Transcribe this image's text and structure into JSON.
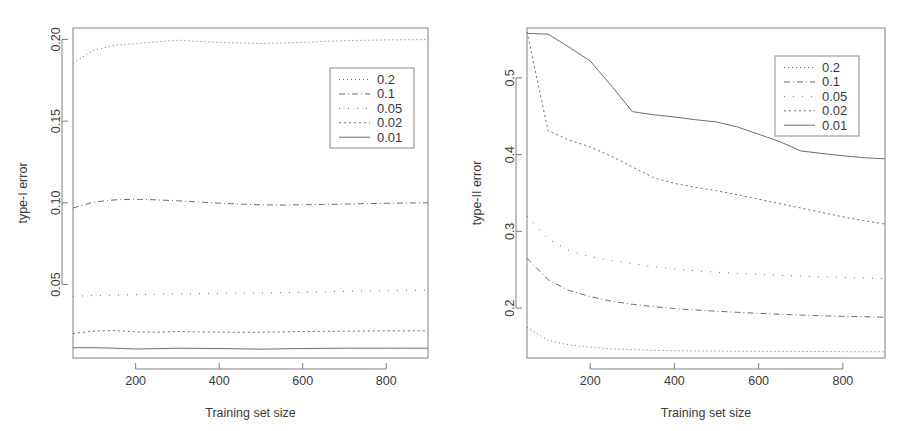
{
  "figure": {
    "panel_count": 2,
    "background_color": "#ffffff",
    "line_color": "#6e6e6e",
    "axis_color": "#808080"
  },
  "chart_data": [
    {
      "type": "line",
      "title": "",
      "xlabel": "Training set size",
      "ylabel": "type-I error",
      "xlim": [
        50,
        900
      ],
      "ylim": [
        0.005,
        0.207
      ],
      "xticks": [
        200,
        400,
        600,
        800
      ],
      "yticks": [
        0.05,
        0.1,
        0.15,
        0.2
      ],
      "ytick_labels": [
        "0.05",
        "0.10",
        "0.15",
        "0.20"
      ],
      "xtick_labels": [
        "200",
        "400",
        "600",
        "800"
      ],
      "grid": false,
      "legend_position": "upper right",
      "legend_title": "",
      "x": [
        50,
        100,
        150,
        200,
        250,
        300,
        350,
        400,
        450,
        500,
        550,
        600,
        650,
        700,
        750,
        800,
        850,
        900
      ],
      "series": [
        {
          "name": "0.2",
          "dash": "1,3",
          "width": 1,
          "values": [
            0.1855,
            0.1935,
            0.1965,
            0.1975,
            0.1985,
            0.1995,
            0.1988,
            0.1982,
            0.1978,
            0.1975,
            0.1978,
            0.1982,
            0.1988,
            0.1992,
            0.1995,
            0.1997,
            0.1998,
            0.1999
          ]
        },
        {
          "name": "0.1",
          "dash": "6,3,1,3",
          "width": 1,
          "values": [
            0.0968,
            0.1005,
            0.1018,
            0.1022,
            0.1018,
            0.1012,
            0.1005,
            0.0998,
            0.0992,
            0.0988,
            0.0986,
            0.0988,
            0.099,
            0.0992,
            0.0995,
            0.0997,
            0.0999,
            0.1
          ]
        },
        {
          "name": "0.05",
          "dash": "1,8",
          "width": 1,
          "values": [
            0.0428,
            0.0432,
            0.0435,
            0.0438,
            0.044,
            0.0442,
            0.0444,
            0.0446,
            0.0447,
            0.0448,
            0.045,
            0.0452,
            0.0455,
            0.0458,
            0.046,
            0.0462,
            0.0464,
            0.0465
          ]
        },
        {
          "name": "0.02",
          "dash": "2,3",
          "width": 1,
          "values": [
            0.02,
            0.0215,
            0.0218,
            0.021,
            0.0208,
            0.0212,
            0.021,
            0.0208,
            0.0207,
            0.0208,
            0.021,
            0.0212,
            0.0213,
            0.0214,
            0.0215,
            0.0216,
            0.0216,
            0.0217
          ]
        },
        {
          "name": "0.01",
          "dash": "",
          "width": 1,
          "values": [
            0.0113,
            0.0113,
            0.011,
            0.0105,
            0.0107,
            0.011,
            0.0109,
            0.0108,
            0.0106,
            0.0104,
            0.0106,
            0.0108,
            0.0109,
            0.011,
            0.011,
            0.011,
            0.011,
            0.011
          ]
        }
      ]
    },
    {
      "type": "line",
      "title": "",
      "xlabel": "Training set size",
      "ylabel": "type-II error",
      "xlim": [
        50,
        900
      ],
      "ylim": [
        0.135,
        0.565
      ],
      "xticks": [
        200,
        400,
        600,
        800
      ],
      "yticks": [
        0.2,
        0.3,
        0.4,
        0.5
      ],
      "ytick_labels": [
        "0.2",
        "0.3",
        "0.4",
        "0.5"
      ],
      "xtick_labels": [
        "200",
        "400",
        "600",
        "800"
      ],
      "grid": false,
      "legend_position": "upper right",
      "legend_title": "",
      "x": [
        50,
        100,
        150,
        200,
        250,
        300,
        350,
        400,
        450,
        500,
        550,
        600,
        650,
        700,
        750,
        800,
        850,
        900
      ],
      "series": [
        {
          "name": "0.2",
          "dash": "1,3",
          "width": 1,
          "values": [
            0.175,
            0.158,
            0.152,
            0.149,
            0.147,
            0.146,
            0.145,
            0.1445,
            0.1442,
            0.144,
            0.1438,
            0.1437,
            0.1436,
            0.1435,
            0.1434,
            0.1433,
            0.1432,
            0.143
          ]
        },
        {
          "name": "0.1",
          "dash": "6,3,1,3",
          "width": 1,
          "values": [
            0.265,
            0.237,
            0.223,
            0.215,
            0.209,
            0.205,
            0.202,
            0.1995,
            0.1975,
            0.196,
            0.1945,
            0.1932,
            0.192,
            0.191,
            0.19,
            0.1893,
            0.1887,
            0.1882
          ]
        },
        {
          "name": "0.05",
          "dash": "1,8",
          "width": 1,
          "values": [
            0.32,
            0.29,
            0.275,
            0.267,
            0.262,
            0.258,
            0.254,
            0.251,
            0.2487,
            0.2468,
            0.2452,
            0.244,
            0.2428,
            0.2418,
            0.2408,
            0.24,
            0.2392,
            0.2385
          ]
        },
        {
          "name": "0.02",
          "dash": "2,3",
          "width": 1,
          "values": [
            0.56,
            0.431,
            0.419,
            0.41,
            0.398,
            0.384,
            0.37,
            0.3625,
            0.3575,
            0.353,
            0.3478,
            0.342,
            0.336,
            0.3305,
            0.3245,
            0.319,
            0.314,
            0.3095
          ]
        },
        {
          "name": "0.01",
          "dash": "",
          "width": 1,
          "values": [
            0.558,
            0.557,
            0.54,
            0.522,
            0.49,
            0.456,
            0.452,
            0.449,
            0.4455,
            0.4425,
            0.436,
            0.4265,
            0.417,
            0.4048,
            0.4015,
            0.3985,
            0.396,
            0.3945
          ]
        }
      ]
    }
  ]
}
